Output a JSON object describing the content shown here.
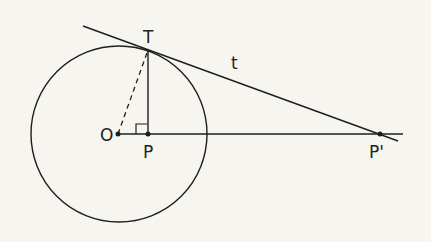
{
  "diagram": {
    "background": "#f7f5ef",
    "stroke": "#1e1e1e",
    "labels": {
      "T": "T",
      "t": "t",
      "O": "O",
      "P": "P",
      "P_prime": "P'"
    },
    "elements": [
      "circle centered at O",
      "tangent line t touching circle at T",
      "dashed radius O to T",
      "perpendicular segment T to P with right-angle marker",
      "horizontal line through O, P, P'"
    ]
  }
}
